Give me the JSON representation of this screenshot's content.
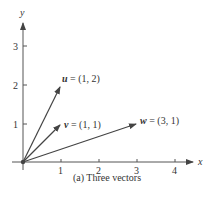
{
  "figure": {
    "caption": "(a) Three vectors",
    "axes": {
      "x_label": "x",
      "y_label": "y",
      "x_ticks": [
        "1",
        "2",
        "3",
        "4"
      ],
      "y_ticks": [
        "1",
        "2",
        "3"
      ]
    },
    "vectors": [
      {
        "name": "u",
        "label_name": "u",
        "label_eq": " = (1, 2)",
        "x": 1,
        "y": 2
      },
      {
        "name": "v",
        "label_name": "v",
        "label_eq": " = (1, 1)",
        "x": 1,
        "y": 1
      },
      {
        "name": "w",
        "label_name": "w",
        "label_eq": " = (3, 1)",
        "x": 3,
        "y": 1
      }
    ],
    "colors": {
      "axis": "#444444",
      "vector": "#444444",
      "text": "#333333"
    }
  }
}
